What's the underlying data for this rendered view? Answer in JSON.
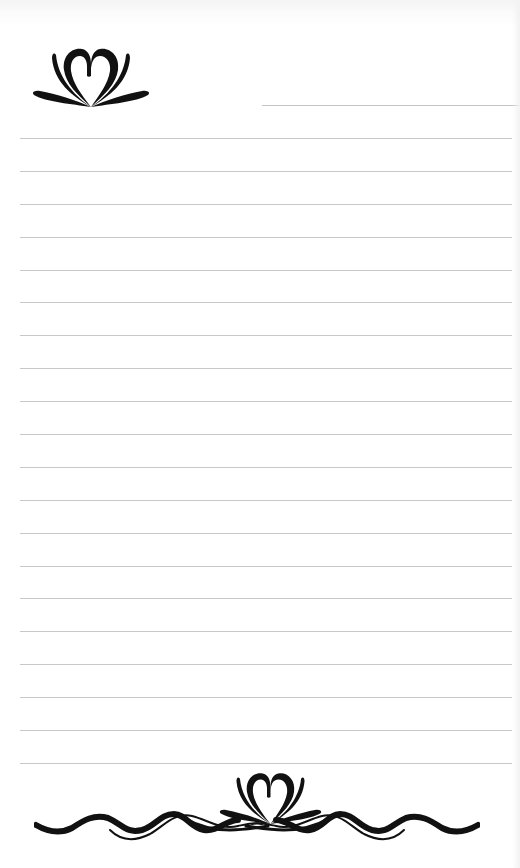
{
  "page": {
    "type": "ruled-stationery",
    "background_color": "#ffffff",
    "rule_color": "#c8c8c8",
    "ornament_color": "#111111"
  },
  "header": {
    "ornament": "lotus-heart-icon",
    "name_line": "short-signature-line"
  },
  "rules": {
    "count": 20,
    "positions_y": [
      138,
      171,
      204,
      237,
      270,
      302,
      335,
      368,
      401,
      434,
      467,
      500,
      533,
      566,
      598,
      631,
      664,
      697,
      730,
      763
    ]
  },
  "footer": {
    "ornament": "lotus-heart-icon",
    "flourish": "wave-flourish-icon"
  }
}
